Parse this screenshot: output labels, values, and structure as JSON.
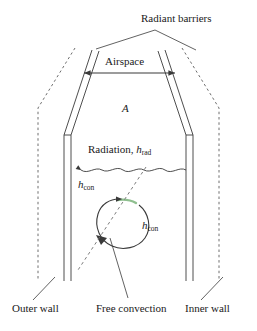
{
  "diagram": {
    "title_label": "Radiant barriers",
    "airspace_label": "Airspace",
    "area_label": "A",
    "radiation_label": "Radiation, ",
    "radiation_var": "h",
    "radiation_sub": "rad",
    "hcon_var_left": "h",
    "hcon_sub_left": "con",
    "hcon_var_right": "h",
    "hcon_sub_right": "con",
    "outer_wall_label": "Outer wall",
    "free_convection_label": "Free convection",
    "inner_wall_label": "Inner wall",
    "colors": {
      "line": "#3a3a3a",
      "dashed": "#6e6e6e",
      "text": "#1a1a1a",
      "accent_green": "#8fbf8f",
      "background": "#ffffff"
    }
  }
}
